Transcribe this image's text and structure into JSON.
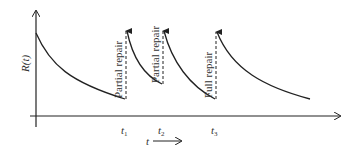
{
  "diagram": {
    "y_axis_label": "R(t)",
    "x_axis_label": "t",
    "x_axis_arrow": "→",
    "ticks": [
      {
        "base": "t",
        "sub": "1"
      },
      {
        "base": "t",
        "sub": "2"
      },
      {
        "base": "t",
        "sub": "3"
      }
    ],
    "events": [
      {
        "label": "Partial repair",
        "type": "partial"
      },
      {
        "label": "Partial repair",
        "type": "partial"
      },
      {
        "label": "Full repair",
        "type": "full"
      }
    ],
    "colors": {
      "line": "#222222",
      "text": "#333333",
      "background": "#ffffff"
    }
  }
}
